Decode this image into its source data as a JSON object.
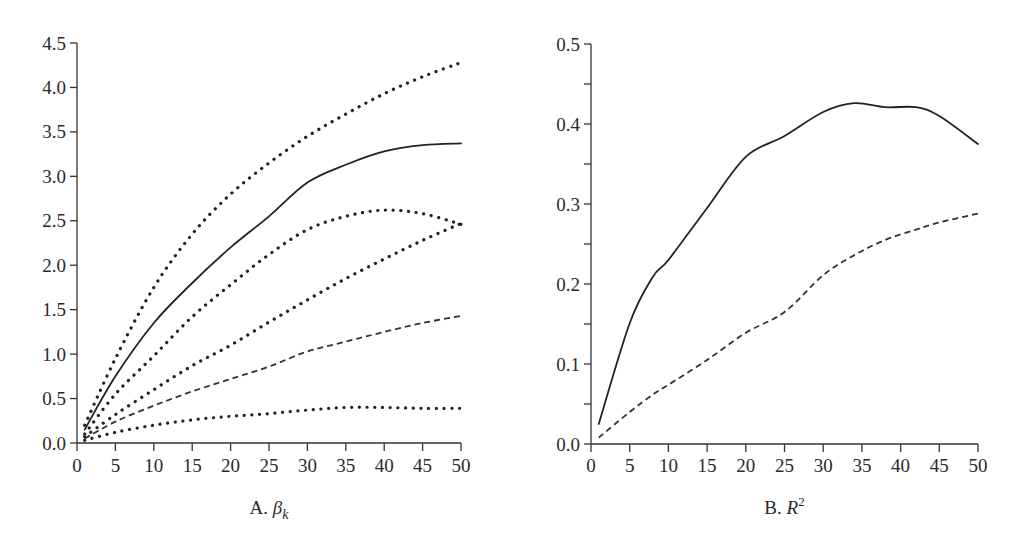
{
  "chart_data": [
    {
      "type": "line",
      "panel": "A",
      "title": "",
      "xlabel": "A. β_k",
      "xlabel_prefix": "A. ",
      "xlabel_symbol": "β",
      "xlabel_subscript": "k",
      "ylabel": "",
      "xlim": [
        0,
        50
      ],
      "ylim": [
        0.0,
        4.5
      ],
      "x_ticks": [
        0,
        5,
        10,
        15,
        20,
        25,
        30,
        35,
        40,
        45,
        50
      ],
      "x_tick_labels": [
        "0",
        "5",
        "10",
        "15",
        "20",
        "25",
        "30",
        "35",
        "40",
        "45",
        "50"
      ],
      "y_ticks": [
        0.0,
        0.5,
        1.0,
        1.5,
        2.0,
        2.5,
        3.0,
        3.5,
        4.0,
        4.5
      ],
      "y_tick_labels": [
        "0.0",
        "0.5",
        "1.0",
        "1.5",
        "2.0",
        "2.5",
        "3.0",
        "3.5",
        "4.0",
        "4.5"
      ],
      "grid": false,
      "legend": null,
      "x": [
        1,
        5,
        10,
        15,
        20,
        25,
        30,
        35,
        40,
        45,
        50
      ],
      "series": [
        {
          "name": "upper dotted band",
          "style": "dotted",
          "values": [
            0.2,
            0.95,
            1.75,
            2.35,
            2.8,
            3.15,
            3.45,
            3.7,
            3.93,
            4.12,
            4.28
          ]
        },
        {
          "name": "solid",
          "style": "solid",
          "values": [
            0.15,
            0.75,
            1.35,
            1.8,
            2.2,
            2.55,
            2.93,
            3.13,
            3.28,
            3.35,
            3.37
          ]
        },
        {
          "name": "middle dotted band",
          "style": "dotted",
          "values": [
            0.1,
            0.55,
            0.98,
            1.42,
            1.78,
            2.12,
            2.4,
            2.55,
            2.62,
            2.58,
            2.46
          ]
        },
        {
          "name": "lower dotted band",
          "style": "dotted",
          "values": [
            0.07,
            0.32,
            0.6,
            0.87,
            1.1,
            1.36,
            1.61,
            1.85,
            2.07,
            2.28,
            2.47
          ]
        },
        {
          "name": "dashed",
          "style": "dashed",
          "values": [
            0.05,
            0.24,
            0.42,
            0.58,
            0.72,
            0.86,
            1.03,
            1.14,
            1.25,
            1.35,
            1.43
          ]
        },
        {
          "name": "bottom dotted band",
          "style": "dotted",
          "values": [
            0.03,
            0.12,
            0.2,
            0.26,
            0.3,
            0.33,
            0.37,
            0.4,
            0.4,
            0.39,
            0.39
          ]
        }
      ]
    },
    {
      "type": "line",
      "panel": "B",
      "title": "",
      "xlabel": "B. R^2",
      "xlabel_prefix": "B. ",
      "xlabel_symbol": "R",
      "xlabel_superscript": "2",
      "ylabel": "",
      "xlim": [
        0,
        50
      ],
      "ylim": [
        0.0,
        0.5
      ],
      "x_ticks": [
        0,
        5,
        10,
        15,
        20,
        25,
        30,
        35,
        40,
        45,
        50
      ],
      "x_tick_labels": [
        "0",
        "5",
        "10",
        "15",
        "20",
        "25",
        "30",
        "35",
        "40",
        "45",
        "50"
      ],
      "y_ticks": [
        0.0,
        0.1,
        0.2,
        0.3,
        0.4,
        0.5
      ],
      "y_tick_labels": [
        "0.0",
        "0.1",
        "0.2",
        "0.3",
        "0.4",
        "0.5"
      ],
      "y_minor_ticks": [
        0.05,
        0.15,
        0.25,
        0.35,
        0.45
      ],
      "grid": false,
      "legend": null,
      "x": [
        1,
        5,
        8,
        10,
        15,
        20,
        25,
        30,
        34,
        38,
        42,
        45,
        50
      ],
      "series": [
        {
          "name": "solid",
          "style": "solid",
          "values": [
            0.025,
            0.151,
            0.209,
            0.23,
            0.295,
            0.359,
            0.385,
            0.415,
            0.426,
            0.421,
            0.421,
            0.41,
            0.375
          ]
        },
        {
          "name": "dashed",
          "style": "dashed",
          "values": [
            0.008,
            0.04,
            0.062,
            0.074,
            0.105,
            0.139,
            0.165,
            0.211,
            0.236,
            0.255,
            0.268,
            0.277,
            0.288
          ]
        }
      ]
    }
  ],
  "layout": {
    "panels": [
      {
        "x0": 77,
        "x1": 461,
        "y0": 443,
        "y1": 43,
        "label_y": 514,
        "tick_label_y": 472
      },
      {
        "x0": 591,
        "x1": 978,
        "y0": 444,
        "y1": 44,
        "label_y": 514,
        "tick_label_y": 472
      }
    ]
  }
}
